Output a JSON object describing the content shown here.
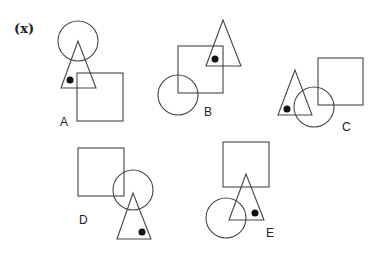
{
  "question": {
    "label": "(x)"
  },
  "options": [
    {
      "id": "A",
      "label": "A",
      "label_pos": [
        60,
        126
      ],
      "circle": {
        "cx": 78,
        "cy": 41,
        "r": 20
      },
      "triangle": [
        [
          78,
          41
        ],
        [
          61,
          88
        ],
        [
          96,
          88
        ]
      ],
      "square": {
        "x": 77,
        "y": 73,
        "w": 46,
        "h": 48
      },
      "dot": {
        "cx": 70,
        "cy": 80,
        "r": 3.5
      }
    },
    {
      "id": "B",
      "label": "B",
      "label_pos": [
        204,
        116
      ],
      "circle": {
        "cx": 178,
        "cy": 95,
        "r": 20
      },
      "triangle": [
        [
          223,
          20
        ],
        [
          206,
          66
        ],
        [
          241,
          66
        ]
      ],
      "square": {
        "x": 178,
        "y": 46,
        "w": 45,
        "h": 47
      },
      "dot": {
        "cx": 215,
        "cy": 59,
        "r": 3.5
      }
    },
    {
      "id": "C",
      "label": "C",
      "label_pos": [
        342,
        131
      ],
      "circle": {
        "cx": 314,
        "cy": 107,
        "r": 20
      },
      "triangle": [
        [
          295,
          70
        ],
        [
          278,
          115
        ],
        [
          312,
          115
        ]
      ],
      "square": {
        "x": 318,
        "y": 58,
        "w": 45,
        "h": 47
      },
      "dot": {
        "cx": 287,
        "cy": 109,
        "r": 3.5
      }
    },
    {
      "id": "D",
      "label": "D",
      "label_pos": [
        79,
        224
      ],
      "circle": {
        "cx": 133,
        "cy": 190,
        "r": 20
      },
      "triangle": [
        [
          133,
          193
        ],
        [
          117,
          239
        ],
        [
          151,
          239
        ]
      ],
      "square": {
        "x": 78,
        "y": 148,
        "w": 46,
        "h": 48
      },
      "dot": {
        "cx": 142,
        "cy": 232,
        "r": 3.5
      }
    },
    {
      "id": "E",
      "label": "E",
      "label_pos": [
        266,
        237
      ],
      "circle": {
        "cx": 226,
        "cy": 218,
        "r": 20
      },
      "triangle": [
        [
          246,
          174
        ],
        [
          229,
          220
        ],
        [
          264,
          220
        ]
      ],
      "square": {
        "x": 223,
        "y": 142,
        "w": 46,
        "h": 45
      },
      "dot": {
        "cx": 255,
        "cy": 213,
        "r": 3.5
      }
    }
  ]
}
